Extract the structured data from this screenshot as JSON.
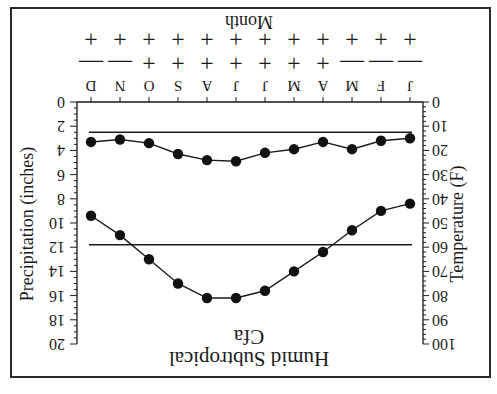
{
  "orientation": "rotated-180",
  "chart_data": {
    "type": "line",
    "title": "Humid Subtropical",
    "subtitle": "Cfa",
    "xlabel": "Month",
    "categories": [
      "J",
      "F",
      "M",
      "A",
      "M",
      "J",
      "J",
      "A",
      "S",
      "O",
      "N",
      "D"
    ],
    "y_left": {
      "label": "Temperature (F)",
      "range": [
        0,
        100
      ],
      "ticks": [
        0,
        10,
        20,
        30,
        40,
        50,
        60,
        70,
        80,
        90,
        100
      ]
    },
    "y_right": {
      "label": "Precipitation (inches)",
      "range": [
        0,
        20
      ],
      "ticks": [
        0,
        2,
        4,
        6,
        8,
        10,
        12,
        14,
        16,
        18,
        20
      ]
    },
    "series": [
      {
        "name": "Temperature (F)",
        "axis": "left",
        "values": [
          42,
          45,
          53,
          62,
          70,
          78,
          81,
          81,
          75,
          65,
          55,
          47
        ]
      },
      {
        "name": "Precipitation (inches)",
        "axis": "right",
        "values": [
          3.0,
          3.2,
          3.9,
          3.3,
          3.9,
          4.2,
          4.9,
          4.8,
          4.3,
          3.4,
          3.1,
          3.3
        ]
      }
    ],
    "reference_lines": [
      {
        "axis": "left",
        "value": 59,
        "note": "horizontal line across temperature curve"
      },
      {
        "axis": "right",
        "value": 2.5,
        "note": "horizontal line above precipitation curve"
      }
    ],
    "sign_rows": [
      [
        "-",
        "-",
        "-",
        "+",
        "+",
        "+",
        "+",
        "+",
        "+",
        "+",
        "-",
        "-"
      ],
      [
        "+",
        "+",
        "+",
        "+",
        "+",
        "+",
        "+",
        "+",
        "+",
        "+",
        "+",
        "+"
      ]
    ],
    "grid": false,
    "legend": "none"
  },
  "labels": {
    "title": "Humid Subtropical",
    "subtitle": "Cfa",
    "xlabel": "Month",
    "left_axis": "Temperature (F)",
    "right_axis": "Precipitation (inches)"
  }
}
